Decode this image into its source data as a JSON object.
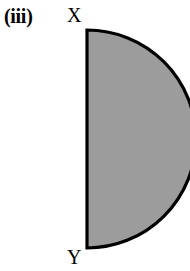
{
  "figure": {
    "caption": "(iii)",
    "shape_name": "semicircle",
    "background_color": "#ffffff"
  },
  "labels": {
    "top_vertex": "X",
    "bottom_vertex": "Y"
  },
  "chart_data": {
    "type": "diagram",
    "title": "(iii)",
    "shape": "semicircle",
    "annotations": [
      {
        "text": "(iii)",
        "role": "figure-label",
        "x": 5,
        "y": 18
      },
      {
        "text": "X",
        "role": "vertex-label",
        "x": 72,
        "y": 20
      },
      {
        "text": "Y",
        "role": "vertex-label",
        "x": 72,
        "y": 262
      }
    ],
    "geometry": {
      "diameter_x": 87,
      "top_point": [
        87,
        30
      ],
      "bottom_point": [
        87,
        248
      ],
      "diameter_length": 218,
      "radius": 109,
      "arc_apex": [
        187,
        139
      ],
      "arc_direction": "right"
    },
    "style": {
      "fill_color": "#9c9c9c",
      "stroke_color": "#000000",
      "stroke_width": 3.2,
      "grid": false,
      "legend": false
    }
  }
}
